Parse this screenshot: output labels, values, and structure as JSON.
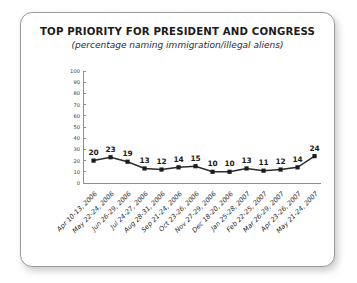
{
  "chart_data": {
    "type": "line",
    "title": "TOP PRIORITY FOR PRESIDENT AND CONGRESS",
    "subtitle": "(percentage naming immigration/illegal aliens)",
    "xlabel": "",
    "ylabel": "",
    "ylim": [
      0,
      100
    ],
    "yticks": [
      0,
      10,
      20,
      30,
      40,
      50,
      60,
      70,
      80,
      90,
      100
    ],
    "ytick_labels": [
      "0",
      "10",
      "20",
      "30",
      "40",
      "50",
      "60",
      "70",
      "80",
      "90",
      "100"
    ],
    "grid": false,
    "legend": null,
    "categories": [
      "Apr 10-13, 2006",
      "May 22-24, 2006",
      "Jun 26-29, 2006",
      "Jul 24-27, 2006",
      "Aug 28-31, 2006",
      "Sep 21-24, 2006",
      "Oct 23-26, 2006",
      "Nov 27-29, 2006",
      "Dec 18-20, 2006",
      "Jan 25-28, 2007",
      "Feb 22-25, 2007",
      "Mar 26-29, 2007",
      "Apr 23-26, 2007",
      "May 21-24, 2007"
    ],
    "values": [
      20,
      23,
      19,
      13,
      12,
      14,
      15,
      10,
      10,
      13,
      11,
      12,
      14,
      24
    ],
    "point_labels": [
      "20",
      "23",
      "19",
      "13",
      "12",
      "14",
      "15",
      "10",
      "10",
      "13",
      "11",
      "12",
      "14",
      "24"
    ],
    "colors": {
      "line": "#2b2b2b",
      "marker": "#1c1c1c",
      "axis": "#8e8e8e",
      "text": "#1b1b1b",
      "frame_border": "#9a9a9a",
      "background": "#ffffff"
    }
  }
}
